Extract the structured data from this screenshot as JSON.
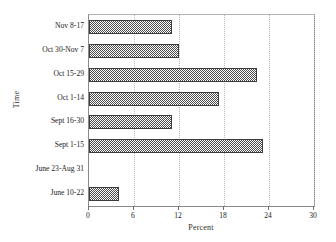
{
  "chart_data": {
    "type": "bar",
    "orientation": "horizontal",
    "title": "",
    "xlabel": "Percent",
    "ylabel": "Time",
    "categories": [
      "June 10-22",
      "June 23-Aug 31",
      "Sept 1-15",
      "Sept 16-30",
      "Oct 1-14",
      "Oct 15-29",
      "Oct 30-Nov 7",
      "Nov 8-17"
    ],
    "values": [
      4.0,
      0.0,
      23.2,
      11.1,
      17.3,
      22.4,
      12.0,
      11.1
    ],
    "xlim": [
      0,
      30
    ],
    "xticks": [
      0,
      6,
      12,
      18,
      24,
      30
    ],
    "xtick_labels": [
      "0",
      "6",
      "12",
      "18",
      "24",
      "30"
    ],
    "grid": "vertical-dotted",
    "legend": "none",
    "bar_fill": "#4a4a4a",
    "bar_pattern": "checkerboard-hatch",
    "frame_color": "#8a8a8a",
    "gridline_color": "#b9b9b9"
  },
  "axis": {
    "y_title": "Time",
    "x_title": "Percent"
  }
}
